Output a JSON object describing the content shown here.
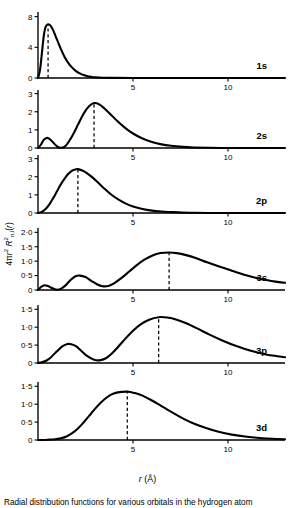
{
  "figure": {
    "xlabel_symbol": "r",
    "xlabel_unit": "(Å)",
    "ylabel": "4πr² R²nl(r)",
    "caption": "Radial distribution functions for various orbitals in the hydrogen atom",
    "x_axis_label_full": "r (Å)"
  },
  "chart_data": {
    "type": "line",
    "title": "Radial distribution functions",
    "xlabel": "r (Å)",
    "ylabel": "4πr² R²nl(r)",
    "xlim": [
      0,
      13
    ],
    "grid": false,
    "legend": "panel-label-right",
    "shared_xticks": [
      {
        "value": 5,
        "label": "5"
      },
      {
        "value": 10,
        "label": "10"
      }
    ],
    "panels": [
      {
        "label": "1s",
        "ylim": [
          0,
          8.6
        ],
        "yticks": [
          {
            "value": 0,
            "label": "0"
          },
          {
            "value": 4,
            "label": "4"
          },
          {
            "value": 8,
            "label": "8"
          }
        ],
        "peak_marker_x": 0.53,
        "peak_value": 7.0,
        "x": [
          0.0,
          0.1,
          0.2,
          0.3,
          0.4,
          0.53,
          0.65,
          0.8,
          1.0,
          1.2,
          1.4,
          1.6,
          1.8,
          2.0,
          2.2,
          2.4,
          2.6,
          2.8,
          3.0,
          3.4,
          4.0,
          5.0,
          6.5,
          8.0,
          10.0,
          12.0,
          13.0
        ],
        "y": [
          0.0,
          0.95,
          3.1,
          5.4,
          6.65,
          7.0,
          6.85,
          6.2,
          5.0,
          3.8,
          2.75,
          1.95,
          1.35,
          0.9,
          0.6,
          0.38,
          0.24,
          0.15,
          0.09,
          0.03,
          0.01,
          0.0,
          0.0,
          0.0,
          0.0,
          0.0,
          0.0
        ]
      },
      {
        "label": "2s",
        "ylim": [
          0,
          3.2
        ],
        "yticks": [
          {
            "value": 0,
            "label": "0"
          },
          {
            "value": 1,
            "label": "1"
          },
          {
            "value": 2,
            "label": "2"
          },
          {
            "value": 3,
            "label": "3"
          }
        ],
        "peak_marker_x": 2.95,
        "peak_value": 2.48,
        "x": [
          0.0,
          0.15,
          0.3,
          0.45,
          0.55,
          0.7,
          0.85,
          1.0,
          1.1,
          1.2,
          1.35,
          1.5,
          1.7,
          1.9,
          2.1,
          2.3,
          2.5,
          2.7,
          2.95,
          3.2,
          3.5,
          3.8,
          4.2,
          4.6,
          5.0,
          5.5,
          6.0,
          6.5,
          7.0,
          7.6,
          8.2,
          9.0,
          10.0,
          11.0,
          12.0,
          13.0
        ],
        "y": [
          0.0,
          0.18,
          0.45,
          0.55,
          0.54,
          0.42,
          0.24,
          0.09,
          0.03,
          0.01,
          0.04,
          0.17,
          0.48,
          0.86,
          1.28,
          1.7,
          2.06,
          2.32,
          2.48,
          2.42,
          2.18,
          1.88,
          1.46,
          1.1,
          0.8,
          0.52,
          0.33,
          0.2,
          0.12,
          0.06,
          0.03,
          0.01,
          0.0,
          0.0,
          0.0,
          0.0
        ]
      },
      {
        "label": "2p",
        "ylim": [
          0,
          3.2
        ],
        "yticks": [
          {
            "value": 0,
            "label": "0"
          },
          {
            "value": 1,
            "label": "1"
          },
          {
            "value": 2,
            "label": "2"
          },
          {
            "value": 3,
            "label": "3"
          }
        ],
        "peak_marker_x": 2.1,
        "peak_value": 2.42,
        "x": [
          0.0,
          0.2,
          0.4,
          0.6,
          0.8,
          1.0,
          1.2,
          1.4,
          1.6,
          1.8,
          2.0,
          2.1,
          2.3,
          2.55,
          2.8,
          3.1,
          3.4,
          3.8,
          4.2,
          4.6,
          5.0,
          5.5,
          6.0,
          6.5,
          7.0,
          7.6,
          8.2,
          9.0,
          10.0,
          11.0,
          12.0,
          13.0
        ],
        "y": [
          0.0,
          0.06,
          0.22,
          0.48,
          0.82,
          1.2,
          1.58,
          1.9,
          2.16,
          2.34,
          2.41,
          2.42,
          2.36,
          2.22,
          2.02,
          1.74,
          1.44,
          1.06,
          0.76,
          0.53,
          0.36,
          0.22,
          0.13,
          0.08,
          0.05,
          0.02,
          0.01,
          0.0,
          0.0,
          0.0,
          0.0,
          0.0
        ]
      },
      {
        "label": "3s",
        "ylim": [
          0,
          2.15
        ],
        "yticks": [
          {
            "value": 0,
            "label": "0"
          },
          {
            "value": 0.5,
            "label": "0·5"
          },
          {
            "value": 1.0,
            "label": "1·0"
          },
          {
            "value": 1.5,
            "label": "1·5"
          },
          {
            "value": 2.0,
            "label": "2·0"
          }
        ],
        "peak_marker_x": 6.9,
        "peak_value": 1.3,
        "x": [
          0.0,
          0.15,
          0.3,
          0.42,
          0.55,
          0.7,
          0.85,
          1.0,
          1.2,
          1.45,
          1.7,
          1.95,
          2.2,
          2.5,
          2.8,
          3.1,
          3.4,
          3.7,
          4.0,
          4.4,
          4.8,
          5.2,
          5.6,
          6.0,
          6.45,
          6.9,
          7.3,
          7.8,
          8.3,
          8.9,
          9.5,
          10.2,
          11.0,
          11.8,
          12.5,
          13.0
        ],
        "y": [
          0.0,
          0.1,
          0.16,
          0.155,
          0.13,
          0.08,
          0.035,
          0.01,
          0.04,
          0.16,
          0.34,
          0.47,
          0.5,
          0.45,
          0.32,
          0.2,
          0.13,
          0.14,
          0.23,
          0.42,
          0.64,
          0.86,
          1.05,
          1.19,
          1.28,
          1.3,
          1.28,
          1.21,
          1.11,
          0.96,
          0.82,
          0.67,
          0.5,
          0.37,
          0.29,
          0.25
        ]
      },
      {
        "label": "3p",
        "ylim": [
          0,
          1.62
        ],
        "yticks": [
          {
            "value": 0,
            "label": "0"
          },
          {
            "value": 0.5,
            "label": "0·5"
          },
          {
            "value": 1.0,
            "label": "1·0"
          },
          {
            "value": 1.5,
            "label": "1·5"
          }
        ],
        "peak_marker_x": 6.35,
        "peak_value": 1.28,
        "x": [
          0.0,
          0.2,
          0.45,
          0.7,
          1.0,
          1.3,
          1.55,
          1.75,
          2.0,
          2.3,
          2.6,
          2.95,
          3.3,
          3.6,
          3.9,
          4.2,
          4.6,
          5.0,
          5.4,
          5.85,
          6.35,
          6.8,
          7.3,
          7.8,
          8.4,
          9.0,
          9.7,
          10.4,
          11.2,
          12.0,
          12.6,
          13.0
        ],
        "y": [
          0.0,
          0.02,
          0.07,
          0.17,
          0.33,
          0.47,
          0.53,
          0.525,
          0.47,
          0.33,
          0.19,
          0.09,
          0.08,
          0.14,
          0.27,
          0.44,
          0.68,
          0.9,
          1.08,
          1.21,
          1.28,
          1.27,
          1.21,
          1.11,
          0.96,
          0.8,
          0.63,
          0.48,
          0.34,
          0.24,
          0.19,
          0.16
        ]
      },
      {
        "label": "3d",
        "ylim": [
          0,
          1.62
        ],
        "yticks": [
          {
            "value": 0,
            "label": "0"
          },
          {
            "value": 0.5,
            "label": "0·5"
          },
          {
            "value": 1.0,
            "label": "1·0"
          },
          {
            "value": 1.5,
            "label": "1·5"
          }
        ],
        "peak_marker_x": 4.7,
        "peak_value": 1.35,
        "x": [
          0.0,
          0.3,
          0.6,
          0.9,
          1.2,
          1.5,
          1.8,
          2.1,
          2.4,
          2.7,
          3.0,
          3.3,
          3.6,
          3.9,
          4.2,
          4.7,
          5.1,
          5.5,
          5.9,
          6.4,
          6.9,
          7.5,
          8.1,
          8.8,
          9.5,
          10.2,
          11.0,
          11.8,
          12.5,
          13.0
        ],
        "y": [
          0.0,
          0.0,
          0.01,
          0.02,
          0.05,
          0.1,
          0.19,
          0.32,
          0.49,
          0.68,
          0.87,
          1.04,
          1.18,
          1.28,
          1.33,
          1.35,
          1.31,
          1.24,
          1.13,
          0.98,
          0.82,
          0.64,
          0.48,
          0.34,
          0.23,
          0.15,
          0.09,
          0.05,
          0.03,
          0.02
        ]
      }
    ]
  }
}
